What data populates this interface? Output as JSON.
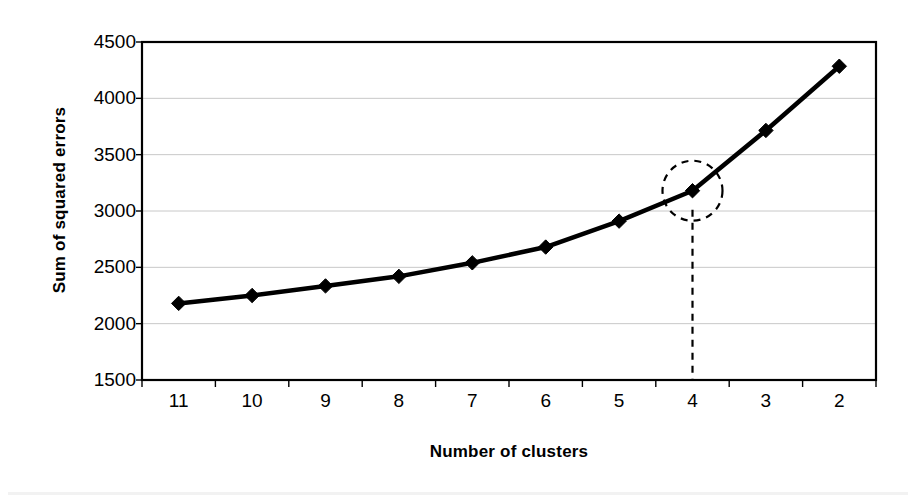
{
  "chart_data": {
    "type": "line",
    "title": "",
    "xlabel": "Number of clusters",
    "ylabel": "Sum of squared errors",
    "categories": [
      "11",
      "10",
      "9",
      "8",
      "7",
      "6",
      "5",
      "4",
      "3",
      "2"
    ],
    "values": [
      2180,
      2250,
      2335,
      2420,
      2540,
      2680,
      2910,
      3180,
      3715,
      4285
    ],
    "ylim": [
      1500,
      4500
    ],
    "ytick_labels": [
      "1500",
      "2000",
      "2500",
      "3000",
      "3500",
      "4000",
      "4500"
    ],
    "ytick_values": [
      1500,
      2000,
      2500,
      3000,
      3500,
      4000,
      4500
    ],
    "grid": "horizontal",
    "legend": "none",
    "marker": "diamond",
    "line_color": "#000000",
    "marker_color": "#000000",
    "gridline_color": "#c8c8c8",
    "axis_color": "#000000",
    "plot_background": "#ffffff",
    "annotations": [
      {
        "name": "elbow-highlight-circle",
        "shape": "dashed-circle",
        "at_category": "4",
        "at_value": 3180,
        "label": ""
      },
      {
        "name": "elbow-dropline",
        "shape": "dashed-vertical-line",
        "at_category": "4",
        "from_value": 3010,
        "to_value": 1500,
        "label": ""
      }
    ]
  }
}
